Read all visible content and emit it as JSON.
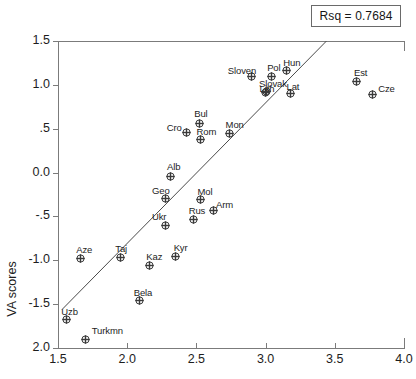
{
  "annotation": {
    "rsq_label": "Rsq = 0.7684"
  },
  "axes": {
    "ylabel": "VA scores",
    "xlabel": "",
    "x_ticks": [
      "1.5",
      "2.0",
      "2.5",
      "3.0",
      "3.5",
      "4.0"
    ],
    "y_ticks": [
      "1.5",
      "1.0",
      ".5",
      "0.0",
      "-.5",
      "-1.0",
      "-1.5",
      "2.0"
    ]
  },
  "chart_data": {
    "type": "scatter",
    "title": "",
    "xlabel": "",
    "ylabel": "VA scores",
    "xlim": [
      1.5,
      4.0
    ],
    "ylim": [
      -2.0,
      1.5
    ],
    "grid": false,
    "legend": null,
    "annotations": [
      "Rsq = 0.7684"
    ],
    "rsq": 0.7684,
    "trendline": {
      "x": [
        1.53,
        3.44
      ],
      "y": [
        -1.56,
        1.5
      ]
    },
    "points": [
      {
        "label": "Uzb",
        "x": 1.56,
        "y": -1.68,
        "lx": -5,
        "ly": -14
      },
      {
        "label": "Aze",
        "x": 1.66,
        "y": -0.98,
        "lx": -4,
        "ly": -15
      },
      {
        "label": "Turkmn",
        "x": 1.7,
        "y": -1.9,
        "lx": 6,
        "ly": -14
      },
      {
        "label": "Taj",
        "x": 1.95,
        "y": -0.97,
        "lx": -5,
        "ly": -15
      },
      {
        "label": "Bela",
        "x": 2.09,
        "y": -1.46,
        "lx": -6,
        "ly": -14
      },
      {
        "label": "Kaz",
        "x": 2.16,
        "y": -1.06,
        "lx": -3,
        "ly": -15
      },
      {
        "label": "Geo",
        "x": 2.28,
        "y": -0.3,
        "lx": -14,
        "ly": -14
      },
      {
        "label": "Ukr",
        "x": 2.28,
        "y": -0.6,
        "lx": -14,
        "ly": -14
      },
      {
        "label": "Alb",
        "x": 2.31,
        "y": -0.04,
        "lx": -3,
        "ly": -15
      },
      {
        "label": "Kyr",
        "x": 2.35,
        "y": -0.96,
        "lx": -2,
        "ly": -15
      },
      {
        "label": "Cro",
        "x": 2.43,
        "y": 0.46,
        "lx": -20,
        "ly": -10
      },
      {
        "label": "Rus",
        "x": 2.48,
        "y": -0.53,
        "lx": -5,
        "ly": -14
      },
      {
        "label": "Bul",
        "x": 2.52,
        "y": 0.56,
        "lx": -5,
        "ly": -15
      },
      {
        "label": "Rom",
        "x": 2.53,
        "y": 0.38,
        "lx": -4,
        "ly": -13
      },
      {
        "label": "Mol",
        "x": 2.53,
        "y": -0.31,
        "lx": -3,
        "ly": -14
      },
      {
        "label": "Arm",
        "x": 2.62,
        "y": -0.43,
        "lx": 3,
        "ly": -11
      },
      {
        "label": "Mon",
        "x": 2.74,
        "y": 0.44,
        "lx": -4,
        "ly": -15
      },
      {
        "label": "Sloven",
        "x": 2.9,
        "y": 1.09,
        "lx": -24,
        "ly": -12
      },
      {
        "label": "Lith",
        "x": 3.0,
        "y": 0.91,
        "lx": -6,
        "ly": -10
      },
      {
        "label": "Slovak",
        "x": 3.01,
        "y": 0.92,
        "lx": -8,
        "ly": -14
      },
      {
        "label": "Pol",
        "x": 3.04,
        "y": 1.1,
        "lx": -4,
        "ly": -14
      },
      {
        "label": "Hun",
        "x": 3.15,
        "y": 1.16,
        "lx": -3,
        "ly": -14
      },
      {
        "label": "Lat",
        "x": 3.18,
        "y": 0.9,
        "lx": -4,
        "ly": -13
      },
      {
        "label": "Est",
        "x": 3.66,
        "y": 1.04,
        "lx": -3,
        "ly": -14
      },
      {
        "label": "Cze",
        "x": 3.77,
        "y": 0.89,
        "lx": 6,
        "ly": -12
      }
    ]
  }
}
